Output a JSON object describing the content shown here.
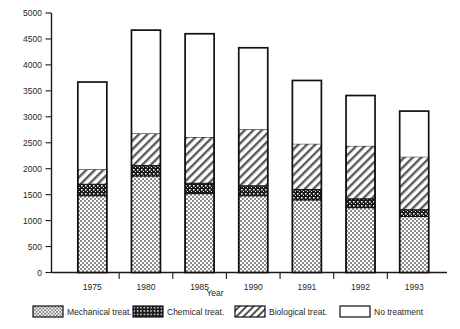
{
  "chart_data": {
    "type": "bar",
    "subtype": "stacked-bar",
    "title": "",
    "xlabel": "Year",
    "ylabel": "",
    "categories": [
      "1975",
      "1980",
      "1985",
      "1990",
      "1991",
      "1992",
      "1993"
    ],
    "ylim": [
      0,
      5000
    ],
    "ytick_step": 500,
    "ytick_labels": [
      "0",
      "500",
      "1000",
      "1500",
      "2000",
      "2500",
      "3000",
      "3500",
      "4000",
      "4500",
      "5000"
    ],
    "ytick_values": [
      0,
      500,
      1000,
      1500,
      2000,
      2500,
      3000,
      3500,
      4000,
      4500,
      5000
    ],
    "grid": false,
    "legend_position": "bottom",
    "series": [
      {
        "name": "Mechanical treat.",
        "pattern": "light-dots",
        "values": [
          1480,
          1860,
          1520,
          1480,
          1400,
          1250,
          1080
        ]
      },
      {
        "name": "Chemical treat.",
        "pattern": "dark-dots",
        "values": [
          220,
          200,
          200,
          190,
          200,
          170,
          130
        ]
      },
      {
        "name": "Biological treat.",
        "pattern": "diagonal-hatch",
        "values": [
          290,
          620,
          890,
          1090,
          880,
          1020,
          1020
        ]
      },
      {
        "name": "No treatment",
        "pattern": "empty",
        "values": [
          1680,
          1990,
          1990,
          1570,
          1220,
          970,
          880
        ]
      }
    ],
    "totals": [
      3670,
      4670,
      4600,
      4330,
      3700,
      3410,
      3110
    ],
    "cumulative_tops": [
      [
        1480,
        1700,
        1990,
        3670
      ],
      [
        1860,
        2060,
        2680,
        4670
      ],
      [
        1520,
        1720,
        2610,
        4600
      ],
      [
        1480,
        1670,
        2760,
        4330
      ],
      [
        1400,
        1600,
        2480,
        3700
      ],
      [
        1250,
        1420,
        2440,
        3410
      ],
      [
        1080,
        1210,
        2230,
        3110
      ]
    ]
  },
  "legend": {
    "items": [
      {
        "label": "Mechanical treat.",
        "swatch": "light-dots-swatch"
      },
      {
        "label": "Chemical treat.",
        "swatch": "dark-dots-swatch"
      },
      {
        "label": "Biological treat.",
        "swatch": "diagonal-hatch-swatch"
      },
      {
        "label": "No treatment",
        "swatch": "empty-swatch"
      }
    ]
  },
  "axes": {
    "x_axis_title": "Year"
  }
}
